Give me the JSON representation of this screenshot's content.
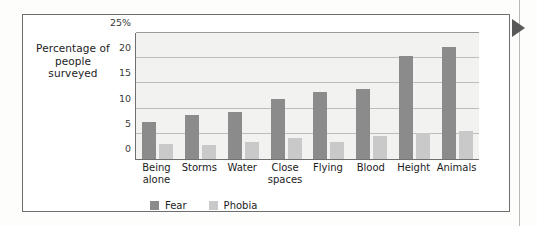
{
  "figure": {
    "edge_marker_icon": "right-triangle-marker"
  },
  "chart_data": {
    "type": "bar",
    "title": "",
    "xlabel": "",
    "ylabel": "Percentage of people surveyed",
    "ylim": [
      0,
      25
    ],
    "yticks": [
      "0",
      "5",
      "10",
      "15",
      "20",
      "25%"
    ],
    "ytick_values": [
      0,
      5,
      10,
      15,
      20,
      25
    ],
    "grid": true,
    "legend_position": "bottom-left",
    "categories": [
      "Being alone",
      "Storms",
      "Water",
      "Close spaces",
      "Flying",
      "Blood",
      "Height",
      "Animals"
    ],
    "category_lines": [
      [
        "Being",
        "alone"
      ],
      [
        "Storms"
      ],
      [
        "Water"
      ],
      [
        "Close",
        "spaces"
      ],
      [
        "Flying"
      ],
      [
        "Blood"
      ],
      [
        "Height"
      ],
      [
        "Animals"
      ]
    ],
    "series": [
      {
        "name": "Fear",
        "color": "#8b8b8b",
        "values": [
          7.3,
          8.7,
          9.4,
          11.9,
          13.2,
          13.9,
          20.4,
          22.2
        ]
      },
      {
        "name": "Phobia",
        "color": "#c9c9c9",
        "values": [
          3.0,
          2.8,
          3.3,
          4.2,
          3.4,
          4.5,
          5.2,
          5.6
        ]
      }
    ]
  }
}
